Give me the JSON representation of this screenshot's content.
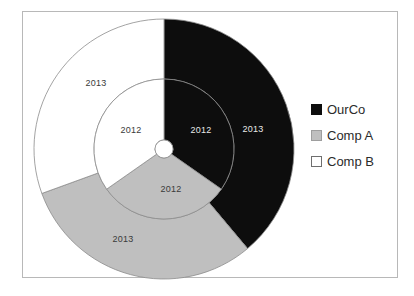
{
  "chart_data": {
    "type": "pie",
    "title": "",
    "subtitle": "",
    "variant": "doughnut",
    "legend_position": "right",
    "grid": false,
    "categories": [
      "OurCo",
      "Comp A",
      "Comp B"
    ],
    "rings": [
      {
        "name": "2012",
        "ring": "inner",
        "label": "2012",
        "values": [
          34.7,
          30.6,
          34.7
        ],
        "slices": [
          {
            "category": "OurCo",
            "label": "2012",
            "value": 34.7,
            "color": "#0d0d0d",
            "start_deg": 0,
            "end_deg": 125
          },
          {
            "category": "Comp A",
            "label": "2012",
            "value": 30.6,
            "color": "#bfbfbf",
            "start_deg": 125,
            "end_deg": 235
          },
          {
            "category": "Comp B",
            "label": "2012",
            "value": 34.7,
            "color": "#ffffff",
            "start_deg": 235,
            "end_deg": 360
          }
        ]
      },
      {
        "name": "2013",
        "ring": "outer",
        "label": "2013",
        "values": [
          38.9,
          30.6,
          30.5
        ],
        "slices": [
          {
            "category": "OurCo",
            "label": "2013",
            "value": 38.9,
            "color": "#0d0d0d",
            "start_deg": 0,
            "end_deg": 140
          },
          {
            "category": "Comp A",
            "label": "2013",
            "value": 30.6,
            "color": "#bfbfbf",
            "start_deg": 140,
            "end_deg": 250
          },
          {
            "category": "Comp B",
            "label": "2013",
            "value": 30.5,
            "color": "#ffffff",
            "start_deg": 250,
            "end_deg": 360
          }
        ]
      }
    ],
    "geometry": {
      "center_x": 163,
      "center_y": 148,
      "hole_radius": 9,
      "inner_ring_outer_radius": 70,
      "outer_ring_outer_radius": 130
    },
    "colors": {
      "ourco": "#0d0d0d",
      "comp_a": "#bfbfbf",
      "comp_b": "#ffffff",
      "slice_border": "#8c8c8c",
      "frame_border": "#b8b8b8",
      "label_dark": "#3a3a3a",
      "label_light": "#e8e8e8"
    },
    "data_labels": [
      {
        "id": "outer-compb",
        "text": "2013",
        "x": 95,
        "y": 82,
        "on_dark": false
      },
      {
        "id": "outer-ourco",
        "text": "2013",
        "x": 252,
        "y": 128,
        "on_dark": true
      },
      {
        "id": "outer-compa",
        "text": "2013",
        "x": 122,
        "y": 238,
        "on_dark": false
      },
      {
        "id": "inner-compb",
        "text": "2012",
        "x": 130,
        "y": 129,
        "on_dark": false
      },
      {
        "id": "inner-ourco",
        "text": "2012",
        "x": 200,
        "y": 129,
        "on_dark": true
      },
      {
        "id": "inner-compa",
        "text": "2012",
        "x": 170,
        "y": 188,
        "on_dark": false
      }
    ]
  },
  "legend": {
    "items": [
      {
        "label": "OurCo",
        "color": "#0d0d0d",
        "border": "#0d0d0d"
      },
      {
        "label": "Comp A",
        "color": "#bfbfbf",
        "border": "#9e9e9e"
      },
      {
        "label": "Comp B",
        "color": "#ffffff",
        "border": "#6f6f6f"
      }
    ]
  }
}
